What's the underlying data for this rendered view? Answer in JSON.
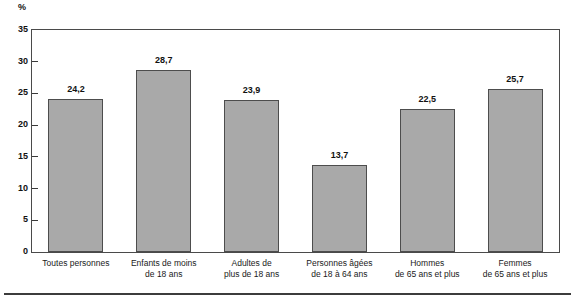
{
  "chart_data": {
    "type": "bar",
    "title": "",
    "subtitle": "",
    "xlabel": "",
    "ylabel": "%",
    "ylim": [
      0,
      35
    ],
    "ytick_step": 5,
    "yticks": [
      "35",
      "30",
      "25",
      "20",
      "15",
      "10",
      "5",
      "0"
    ],
    "grid": false,
    "legend": "none",
    "decimal_separator": ",",
    "categories": [
      "Toutes personnes",
      "Enfants de moins de 18 ans",
      "Adultes de plus de 18 ans",
      "Personnes âgées de 18 à 64 ans",
      "Hommes de 65 ans et plus",
      "Femmes de 65 ans et plus"
    ],
    "category_lines": [
      [
        "Toutes personnes",
        ""
      ],
      [
        "Enfants de moins",
        "de 18 ans"
      ],
      [
        "Adultes de",
        "plus de 18 ans"
      ],
      [
        "Personnes âgées",
        "de 18 à 64 ans"
      ],
      [
        "Hommes",
        "de 65 ans et plus"
      ],
      [
        "Femmes",
        "de 65 ans et plus"
      ]
    ],
    "values": [
      24.2,
      28.7,
      23.9,
      13.7,
      22.5,
      25.7
    ],
    "value_labels": [
      "24,2",
      "28,7",
      "23,9",
      "13,7",
      "22,5",
      "25,7"
    ],
    "colors": {
      "bar_fill": "#a9a9a9",
      "bar_edge": "#4d4d4d",
      "axis": "#4a4a4a",
      "text": "#111111",
      "background": "#ffffff"
    }
  }
}
